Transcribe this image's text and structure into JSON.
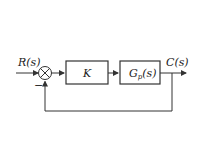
{
  "diagram": {
    "type": "feedback-control-block-diagram",
    "input_label": "R(s)",
    "output_label": "C(s)",
    "feedback_sign": "−",
    "blocks": [
      {
        "id": "controller",
        "label": "K"
      },
      {
        "id": "plant",
        "label_main": "G",
        "label_sub": "p",
        "label_arg": "(s)"
      }
    ],
    "colors": {
      "line": "#333333",
      "background": "#ffffff"
    }
  }
}
